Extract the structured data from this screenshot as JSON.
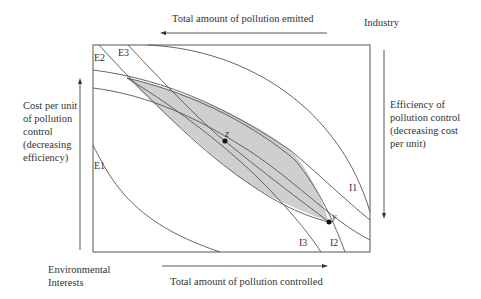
{
  "diagram": {
    "top_axis_label": "Total amount of pollution emitted",
    "bottom_axis_label": "Total amount of pollution controlled",
    "top_right_label": "Industry",
    "bottom_left_label_line1": "Environmental",
    "bottom_left_label_line2": "Interests",
    "left_axis_label": [
      "Cost per unit",
      "of pollution",
      "control",
      "(decreasing",
      "efficiency)"
    ],
    "right_axis_label": [
      "Efficiency of",
      "pollution control",
      "(decreasing cost",
      "per unit)"
    ],
    "curve_labels": {
      "E1": "E1",
      "E2": "E2",
      "E3": "E3",
      "I1": "I1",
      "I2": "I2",
      "I3": "I3"
    },
    "points": {
      "z": "z",
      "y": "y"
    },
    "colors": {
      "line": "#555555",
      "shade": "#cfcfcf",
      "point": "#111111"
    }
  }
}
